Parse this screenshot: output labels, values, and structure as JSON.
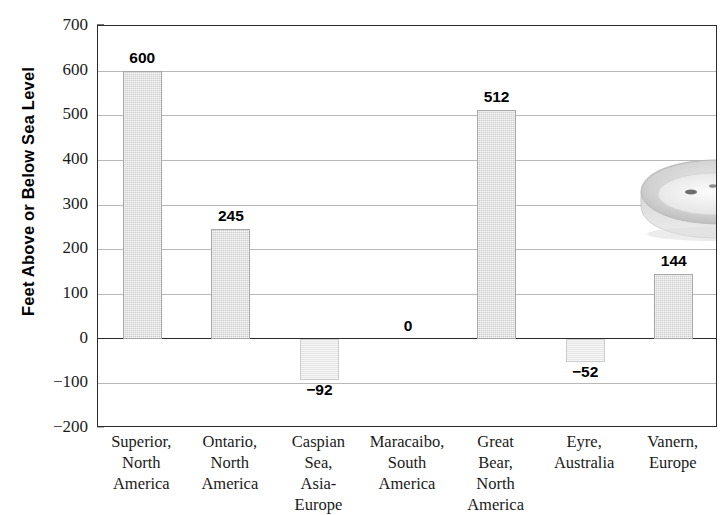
{
  "chart_data": {
    "type": "bar",
    "title": "",
    "xlabel": "",
    "ylabel": "Feet Above or Below Sea Level",
    "ylim": [
      -200,
      700
    ],
    "ytick_step": 100,
    "yticks": [
      700,
      600,
      500,
      400,
      300,
      200,
      100,
      0,
      -100,
      -200
    ],
    "ytick_labels": [
      "700",
      "600",
      "500",
      "400",
      "300",
      "200",
      "100",
      "0",
      "−100",
      "−200"
    ],
    "grid": true,
    "legend": "none",
    "categories": [
      "Superior, North America",
      "Ontario, North America",
      "Caspian Sea, Asia-Europe",
      "Maracaibo, South America",
      "Great Bear, North America",
      "Eyre, Australia",
      "Vanern, Europe"
    ],
    "category_lines": [
      [
        "Superior,",
        "North",
        "America"
      ],
      [
        "Ontario,",
        "North",
        "America"
      ],
      [
        "Caspian",
        "Sea,",
        "Asia-",
        "Europe"
      ],
      [
        "Maracaibo,",
        "South",
        "America"
      ],
      [
        "Great",
        "Bear,",
        "North",
        "America"
      ],
      [
        "Eyre,",
        "Australia"
      ],
      [
        "Vanern,",
        "Europe"
      ]
    ],
    "values": [
      600,
      245,
      -92,
      0,
      512,
      -52,
      144
    ],
    "value_labels": [
      "600",
      "245",
      "−92",
      "0",
      "512",
      "−52",
      "144"
    ],
    "colors": {
      "bar_positive": "#cfcfcf",
      "bar_negative": "#e6e6e6",
      "axis": "#2b2b2b",
      "gridline": "#b9b9b9",
      "text": "#1a1a1a"
    }
  },
  "decoration": {
    "graphic_name": "lake-illustration",
    "description": "3d shaded lake basin with reeds"
  }
}
